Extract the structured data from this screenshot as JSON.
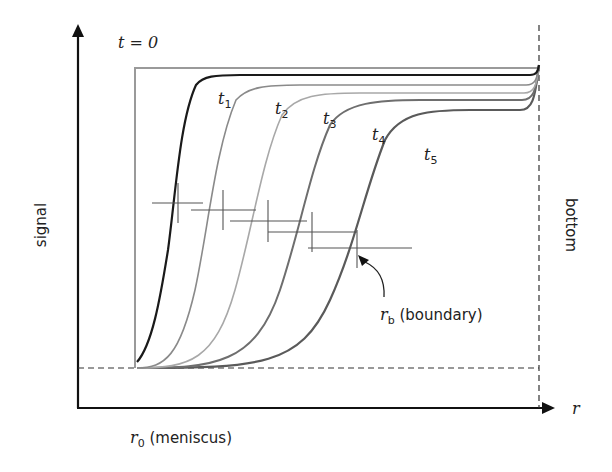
{
  "figure": {
    "labels": {
      "y_axis": "signal",
      "x_axis": "r",
      "right_axis": "bottom",
      "t0": "t = 0",
      "meniscus_symbol": "r",
      "meniscus_sub": "0",
      "meniscus_text": " (meniscus)",
      "boundary_symbol": "r",
      "boundary_sub": "b",
      "boundary_text": " (boundary)"
    },
    "curves": [
      {
        "name": "t",
        "sub": "1",
        "color": "#1a1a1a"
      },
      {
        "name": "t",
        "sub": "2",
        "color": "#8a8a8a"
      },
      {
        "name": "t",
        "sub": "3",
        "color": "#a8a8a8"
      },
      {
        "name": "t",
        "sub": "4",
        "color": "#6e6e6e"
      },
      {
        "name": "t",
        "sub": "5",
        "color": "#5a5a5a"
      }
    ]
  }
}
